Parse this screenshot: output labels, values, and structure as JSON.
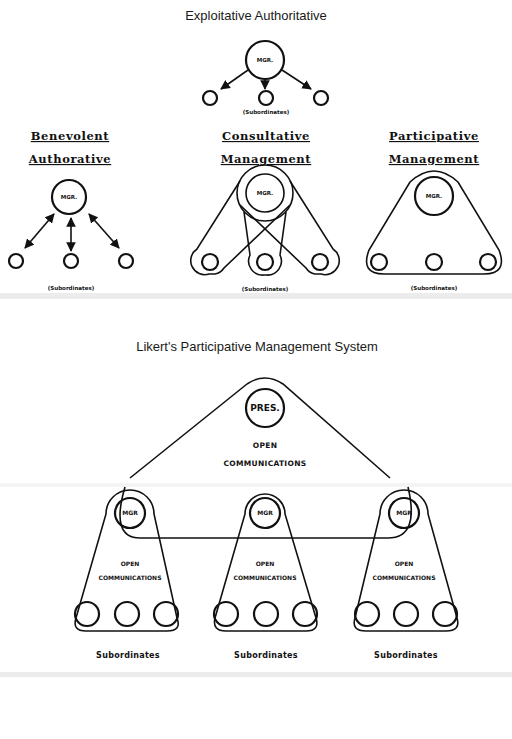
{
  "top": {
    "title": "Exploitative Authoritative",
    "manager_label": "MGR.",
    "subordinates_label": "(Subordinates)"
  },
  "styles": [
    {
      "heading_line1": "Benevolent",
      "heading_line2": "Authorative",
      "manager_label": "MGR.",
      "subordinates_label": "(Subordinates)"
    },
    {
      "heading_line1": "Consultative",
      "heading_line2": "Management",
      "manager_label": "MGR.",
      "subordinates_label": "(Subordinates)"
    },
    {
      "heading_line1": "Participative",
      "heading_line2": "Management",
      "manager_label": "MGR.",
      "subordinates_label": "(Subordinates)"
    }
  ],
  "likert": {
    "title": "Likert's Participative Management System",
    "president_label": "PRES.",
    "open_line1": "OPEN",
    "open_line2": "COMMUNICATIONS",
    "groups": [
      {
        "manager_label": "MGR",
        "open_line1": "OPEN",
        "open_line2": "COMMUNICATIONS",
        "subordinates_label": "Subordinates"
      },
      {
        "manager_label": "MGR",
        "open_line1": "OPEN",
        "open_line2": "COMMUNICATIONS",
        "subordinates_label": "Subordinates"
      },
      {
        "manager_label": "MGR",
        "open_line1": "OPEN",
        "open_line2": "COMMUNICATIONS",
        "subordinates_label": "Subordinates"
      }
    ]
  },
  "colors": {
    "ink": "#111111",
    "paper": "#ffffff",
    "band": "#ececec"
  }
}
